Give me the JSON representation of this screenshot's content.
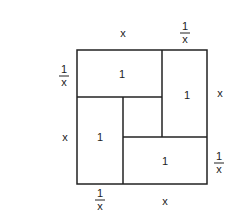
{
  "diagram": {
    "outer_top_labels": [
      "x",
      "1/x"
    ],
    "outer_right_labels": [
      "x",
      "1/x"
    ],
    "outer_bottom_labels": [
      "1/x",
      "x"
    ],
    "outer_left_labels": [
      "1/x",
      "x"
    ],
    "labels": {
      "top_x": "x",
      "top_frac_num": "1",
      "top_frac_den": "x",
      "left_frac_num": "1",
      "left_frac_den": "x",
      "left_x": "x",
      "right_x": "x",
      "right_frac_num": "1",
      "right_frac_den": "x",
      "bottom_frac_num": "1",
      "bottom_frac_den": "x",
      "bottom_x": "x"
    },
    "rectangles": [
      {
        "position": "top-left",
        "area": "1"
      },
      {
        "position": "top-right",
        "area": "1"
      },
      {
        "position": "bottom-left",
        "area": "1"
      },
      {
        "position": "bottom-right",
        "area": "1"
      }
    ],
    "line_color": "#222222"
  }
}
